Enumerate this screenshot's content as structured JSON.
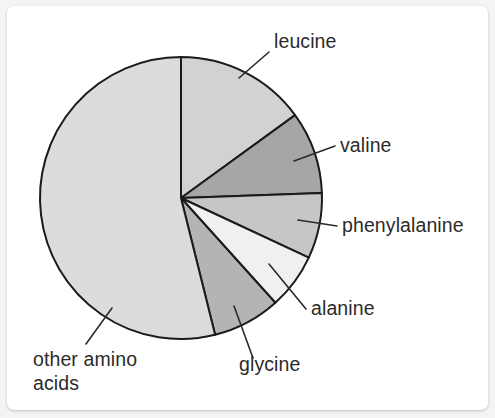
{
  "figure": {
    "background_color": "#f4f4f2",
    "card_color": "#ffffff",
    "outline_color": "#1b1b1b",
    "label_color": "#2b2b2b"
  },
  "chart_data": {
    "type": "pie",
    "title": "",
    "subtitle": "",
    "xlabel": "",
    "ylabel": "",
    "grid": false,
    "legend_position": "none",
    "label_style": "leader-line callouts outside the pie",
    "start_angle_deg": 0,
    "direction": "clockwise",
    "units": "percent of total amino acid residues",
    "categories": [
      "leucine",
      "valine",
      "phenylalanine",
      "alanine",
      "glycine",
      "other amino acids"
    ],
    "values": [
      15.0,
      9.4,
      7.5,
      6.4,
      7.8,
      53.9
    ],
    "slices": [
      {
        "label": "leucine",
        "value": 15.0,
        "angle_deg": 54,
        "start_deg": 0,
        "end_deg": 54,
        "fill": "#d2d2d2",
        "label_x": 267,
        "label_y": 42,
        "leader": "M 232 72 L 262 46"
      },
      {
        "label": "valine",
        "value": 9.4,
        "angle_deg": 34,
        "start_deg": 54,
        "end_deg": 88,
        "fill": "#a6a6a6",
        "label_x": 333,
        "label_y": 146,
        "leader": "M 287 155 L 328 140"
      },
      {
        "label": "phenylalanine",
        "value": 7.5,
        "angle_deg": 27,
        "start_deg": 88,
        "end_deg": 115,
        "fill": "#c6c6c6",
        "label_x": 335,
        "label_y": 226,
        "leader": "M 291 214 L 330 220"
      },
      {
        "label": "alanine",
        "value": 6.4,
        "angle_deg": 23,
        "start_deg": 115,
        "end_deg": 138,
        "fill": "#f0f0f0",
        "label_x": 304,
        "label_y": 309,
        "leader": "M 262 258 L 299 303"
      },
      {
        "label": "glycine",
        "value": 7.8,
        "angle_deg": 28,
        "start_deg": 138,
        "end_deg": 166,
        "fill": "#b4b4b4",
        "label_x": 232,
        "label_y": 365,
        "leader": "M 227 300 L 246 352"
      },
      {
        "label": "other amino\nacids",
        "label_line1": "other amino",
        "label_line2": "acids",
        "value": 53.9,
        "angle_deg": 194,
        "start_deg": 166,
        "end_deg": 360,
        "fill": "#dcdcdc",
        "label_x": 26,
        "label_y": 360,
        "leader": "M 105 302 L 79 338"
      }
    ],
    "geometry": {
      "center_x": 174,
      "center_y": 192,
      "radius": 141
    }
  }
}
